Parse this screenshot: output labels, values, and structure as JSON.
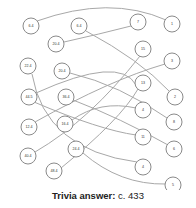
{
  "diagram": {
    "type": "bipartite-matching",
    "left_nodes": [
      {
        "id": "L1",
        "label": "6.4",
        "x": 31,
        "y": 26
      },
      {
        "id": "L2",
        "label": "6.4",
        "x": 79,
        "y": 26
      },
      {
        "id": "L3",
        "label": "20.4",
        "x": 56,
        "y": 44
      },
      {
        "id": "L4",
        "label": "22.4",
        "x": 28,
        "y": 66
      },
      {
        "id": "L5",
        "label": "20.4",
        "x": 62,
        "y": 71
      },
      {
        "id": "L6",
        "label": "44.5",
        "x": 29,
        "y": 97
      },
      {
        "id": "L7",
        "label": "36.4",
        "x": 66,
        "y": 97
      },
      {
        "id": "L8",
        "label": "12.4",
        "x": 29,
        "y": 127
      },
      {
        "id": "L9",
        "label": "16.4",
        "x": 65,
        "y": 124
      },
      {
        "id": "L10",
        "label": "40.4",
        "x": 28,
        "y": 156
      },
      {
        "id": "L11",
        "label": "24.4",
        "x": 76,
        "y": 149
      },
      {
        "id": "L12",
        "label": "48.4",
        "x": 54,
        "y": 171
      }
    ],
    "right_nodes": [
      {
        "id": "R1",
        "label": "7",
        "x": 138,
        "y": 22
      },
      {
        "id": "R2",
        "label": "1",
        "x": 172,
        "y": 24
      },
      {
        "id": "R3",
        "label": "15",
        "x": 143,
        "y": 49
      },
      {
        "id": "R4",
        "label": "3",
        "x": 172,
        "y": 61
      },
      {
        "id": "R5",
        "label": "13",
        "x": 143,
        "y": 83
      },
      {
        "id": "R6",
        "label": "2",
        "x": 175,
        "y": 97
      },
      {
        "id": "R7",
        "label": "4",
        "x": 143,
        "y": 110
      },
      {
        "id": "R8",
        "label": "8",
        "x": 174,
        "y": 122
      },
      {
        "id": "R9",
        "label": "11",
        "x": 143,
        "y": 137
      },
      {
        "id": "R10",
        "label": "6",
        "x": 174,
        "y": 149
      },
      {
        "id": "R11",
        "label": "4",
        "x": 143,
        "y": 167
      },
      {
        "id": "R12",
        "label": "5",
        "x": 173,
        "y": 185
      }
    ],
    "edges": [
      {
        "d": "M37,21 Q110,-5 166,20"
      },
      {
        "d": "M64,42 Q100,34 131,26"
      },
      {
        "d": "M86,31 Q140,60 169,91"
      },
      {
        "d": "M70,73 Q120,85 167,118"
      },
      {
        "d": "M32,74 Q45,150 137,162"
      },
      {
        "d": "M34,102 Q100,130 136,135"
      },
      {
        "d": "M36,93 Q120,55 136,85"
      },
      {
        "d": "M73,100 Q120,118 168,145"
      },
      {
        "d": "M35,122 Q110,80 165,64"
      },
      {
        "d": "M72,120 Q100,100 136,108"
      },
      {
        "d": "M35,152 Q90,120 140,56"
      },
      {
        "d": "M83,153 Q120,185 166,184"
      },
      {
        "d": "M61,168 Q120,120 138,89"
      }
    ]
  },
  "answer": {
    "label": "Trivia answer:",
    "value": "c. 433"
  }
}
